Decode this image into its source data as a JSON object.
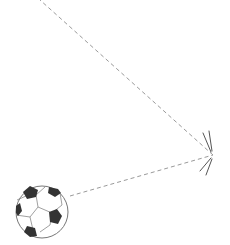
{
  "illustration": {
    "subject": "soccer ball bounce trajectory",
    "colors": {
      "background": "#ffffff",
      "trajectory": "#999999",
      "ball_outline": "#777777",
      "ball_patch": "#333333",
      "impact_lines": "#555555"
    },
    "ball": {
      "cx": 42,
      "cy": 212,
      "r": 26
    },
    "trajectory": {
      "incoming": {
        "from": [
          70,
          196
        ],
        "to": [
          213,
          155
        ]
      },
      "outgoing": {
        "from": [
          213,
          155
        ],
        "to": [
          40,
          0
        ]
      }
    },
    "impact_point": [
      213,
      155
    ]
  }
}
